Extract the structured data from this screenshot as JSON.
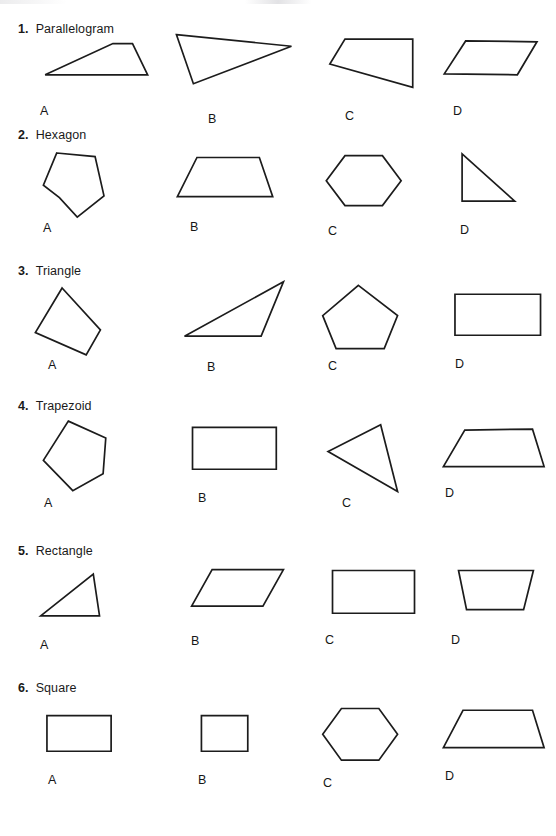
{
  "page": {
    "background_color": "#ffffff",
    "ink_color": "#1c1c1c"
  },
  "questions": [
    {
      "number": "1.",
      "name": "Parallelogram",
      "heading_top": 22,
      "row_top": 32,
      "choices": [
        {
          "letter": "A",
          "shape": "trapezoid",
          "label_x": 22,
          "label_y": 72,
          "points": "22,48 98,13 120,13 137,48"
        },
        {
          "letter": "B",
          "shape": "triangle",
          "label_x": 48,
          "label_y": 80,
          "points": "10,3 139,16 29,58"
        },
        {
          "letter": "C",
          "shape": "quadrilateral",
          "label_x": 45,
          "label_y": 77,
          "points": "42,8 118,8 118,62 25,36"
        },
        {
          "letter": "D",
          "shape": "parallelogram",
          "label_x": 35,
          "label_y": 72,
          "points": "45,10 125,11 103,48 21,47"
        }
      ]
    },
    {
      "number": "2.",
      "name": "Hexagon",
      "heading_top": 128,
      "row_top": 145,
      "choices": [
        {
          "letter": "A",
          "shape": "concave-hexagon",
          "label_x": 25,
          "label_y": 76,
          "points": "35,9 78,13 88,57 58,81 38,59 20,45"
        },
        {
          "letter": "B",
          "shape": "trapezoid",
          "label_x": 30,
          "label_y": 75,
          "points": "33,14 103,14 118,58 11,58"
        },
        {
          "letter": "C",
          "shape": "hexagon",
          "label_x": 28,
          "label_y": 79,
          "points": "42,12 84,12 105,40 84,68 42,68 21,40"
        },
        {
          "letter": "D",
          "shape": "right-triangle",
          "label_x": 42,
          "label_y": 78,
          "points": "41,10 41,63 100,63"
        }
      ]
    },
    {
      "number": "3.",
      "name": "Triangle",
      "heading_top": 264,
      "row_top": 280,
      "choices": [
        {
          "letter": "A",
          "shape": "quadrilateral",
          "label_x": 30,
          "label_y": 78,
          "points": "41,9 84,56 68,84 11,59"
        },
        {
          "letter": "B",
          "shape": "thin-triangle",
          "label_x": 47,
          "label_y": 80,
          "points": "130,2 19,63 105,63"
        },
        {
          "letter": "C",
          "shape": "pentagon",
          "label_x": 28,
          "label_y": 79,
          "points": "57,6 101,40 86,77 32,77 17,40"
        },
        {
          "letter": "D",
          "shape": "rectangle",
          "label_x": 37,
          "label_y": 77,
          "points": "33,16 129,16 129,62 33,62"
        }
      ]
    },
    {
      "number": "4.",
      "name": "Trapezoid",
      "heading_top": 399,
      "row_top": 414,
      "choices": [
        {
          "letter": "A",
          "shape": "rotated-pentagon",
          "label_x": 26,
          "label_y": 82,
          "points": "48,8 90,27 87,67 53,86 20,52"
        },
        {
          "letter": "B",
          "shape": "rectangle",
          "label_x": 38,
          "label_y": 77,
          "points": "28,15 122,15 122,62 28,62"
        },
        {
          "letter": "C",
          "shape": "triangle",
          "label_x": 42,
          "label_y": 82,
          "points": "82,12 101,87 23,42"
        },
        {
          "letter": "D",
          "shape": "trapezoid",
          "label_x": 27,
          "label_y": 72,
          "points": "44,18 120,17 133,59 20,59"
        }
      ]
    },
    {
      "number": "5.",
      "name": "Rectangle",
      "heading_top": 544,
      "row_top": 558,
      "choices": [
        {
          "letter": "A",
          "shape": "triangle",
          "label_x": 22,
          "label_y": 80,
          "points": "76,18 83,65 17,65"
        },
        {
          "letter": "B",
          "shape": "parallelogram",
          "label_x": 31,
          "label_y": 76,
          "points": "50,13 130,13 107,54 27,54"
        },
        {
          "letter": "C",
          "shape": "rectangle",
          "label_x": 25,
          "label_y": 75,
          "points": "28,14 120,14 120,62 28,62"
        },
        {
          "letter": "D",
          "shape": "trapezoid",
          "label_x": 33,
          "label_y": 75,
          "points": "37,14 121,14 110,58 46,58"
        }
      ]
    },
    {
      "number": "6.",
      "name": "Square",
      "heading_top": 681,
      "row_top": 696,
      "choices": [
        {
          "letter": "A",
          "shape": "rectangle",
          "label_x": 30,
          "label_y": 77,
          "points": "24,22 96,22 96,62 24,62"
        },
        {
          "letter": "B",
          "shape": "square",
          "label_x": 38,
          "label_y": 77,
          "points": "38,22 90,22 90,62 38,62"
        },
        {
          "letter": "C",
          "shape": "hexagon",
          "label_x": 23,
          "label_y": 80,
          "points": "38,14 80,14 101,43 80,72 38,72 17,43"
        },
        {
          "letter": "D",
          "shape": "trapezoid",
          "label_x": 27,
          "label_y": 73,
          "points": "42,16 120,16 133,58 20,58"
        }
      ]
    }
  ],
  "column_offsets": [
    18,
    160,
    300,
    418
  ]
}
